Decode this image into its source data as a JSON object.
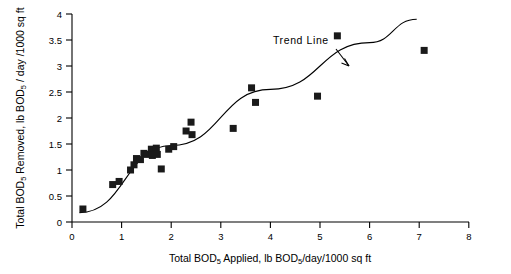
{
  "chart_data": {
    "type": "scatter",
    "title": "",
    "xlabel": "Total BOD5 Applied, lb BOD5/day/1000 sq ft",
    "ylabel": "Total BOD5 Removed, lb BOD5 / day /1000 sq ft",
    "xlim": [
      0,
      8
    ],
    "ylim": [
      0,
      4
    ],
    "xticks": [
      0,
      1,
      2,
      3,
      4,
      5,
      6,
      7,
      8
    ],
    "yticks": [
      0,
      0.5,
      1,
      1.5,
      2,
      2.5,
      3,
      3.5,
      4
    ],
    "xtick_labels": [
      "0",
      "1",
      "2",
      "3",
      "4",
      "5",
      "6",
      "7",
      "8"
    ],
    "ytick_labels": [
      "0",
      "0.5",
      "1",
      "1.5",
      "2",
      "2.5",
      "3",
      "3.5",
      "4"
    ],
    "grid": false,
    "legend": null,
    "series": [
      {
        "name": "Data points",
        "marker": "square",
        "color": "#1a1a1a",
        "points": [
          [
            0.22,
            0.25
          ],
          [
            0.82,
            0.72
          ],
          [
            0.95,
            0.78
          ],
          [
            1.18,
            1.0
          ],
          [
            1.25,
            1.1
          ],
          [
            1.3,
            1.22
          ],
          [
            1.38,
            1.2
          ],
          [
            1.45,
            1.32
          ],
          [
            1.52,
            1.3
          ],
          [
            1.6,
            1.4
          ],
          [
            1.62,
            1.28
          ],
          [
            1.7,
            1.42
          ],
          [
            1.72,
            1.3
          ],
          [
            1.8,
            1.02
          ],
          [
            1.95,
            1.4
          ],
          [
            2.05,
            1.45
          ],
          [
            2.3,
            1.75
          ],
          [
            2.4,
            1.92
          ],
          [
            2.42,
            1.68
          ],
          [
            3.25,
            1.8
          ],
          [
            3.62,
            2.58
          ],
          [
            3.7,
            2.3
          ],
          [
            4.95,
            2.42
          ],
          [
            5.35,
            3.58
          ],
          [
            7.1,
            3.3
          ]
        ]
      }
    ],
    "trend_line": {
      "label": "Trend  Line",
      "points": [
        [
          0.15,
          0.18
        ],
        [
          2.0,
          1.47
        ],
        [
          4.0,
          2.55
        ],
        [
          6.0,
          3.45
        ],
        [
          6.95,
          3.9
        ]
      ]
    },
    "annotations": [
      {
        "text": "Trend  Line",
        "x": 4.05,
        "y": 3.52,
        "arrow_to": [
          4.92,
          3.05
        ]
      }
    ]
  }
}
